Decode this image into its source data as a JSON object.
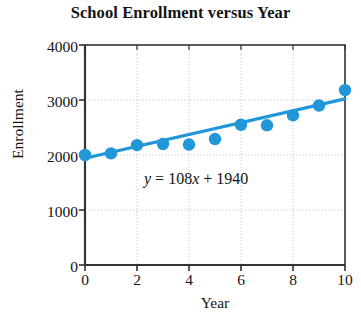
{
  "chart_data": {
    "type": "scatter",
    "title": "School Enrollment versus Year",
    "xlabel": "Year",
    "ylabel": "Enrollment",
    "x": [
      0,
      1,
      2,
      3,
      4,
      5,
      6,
      7,
      8,
      9,
      10
    ],
    "values": [
      2000,
      2030,
      2180,
      2200,
      2190,
      2290,
      2550,
      2540,
      2720,
      2900,
      3180
    ],
    "series": [
      {
        "name": "Enrollment",
        "values": [
          2000,
          2030,
          2180,
          2200,
          2190,
          2290,
          2550,
          2540,
          2720,
          2900,
          3180
        ]
      }
    ],
    "trendline": {
      "slope": 108,
      "intercept": 1940,
      "equation": "y = 108x + 1940"
    },
    "xlim": [
      0,
      10
    ],
    "ylim": [
      0,
      4000
    ],
    "xticks": [
      "0",
      "2",
      "4",
      "6",
      "8",
      "10"
    ],
    "xtick_values": [
      0,
      2,
      4,
      6,
      8,
      10
    ],
    "yticks": [
      "0",
      "1000",
      "2000",
      "3000",
      "4000"
    ],
    "ytick_values": [
      0,
      1000,
      2000,
      3000,
      4000
    ],
    "grid": true,
    "legend": "none",
    "marker_color": "#2196D8",
    "line_color": "#2196D8",
    "axis_color": "#333333",
    "grid_color": "#bbbbbb",
    "background": "#ffffff"
  },
  "annotations": {
    "equation_y": "y",
    "equation_eq": " = 108",
    "equation_x": "x",
    "equation_tail": " + 1940"
  }
}
